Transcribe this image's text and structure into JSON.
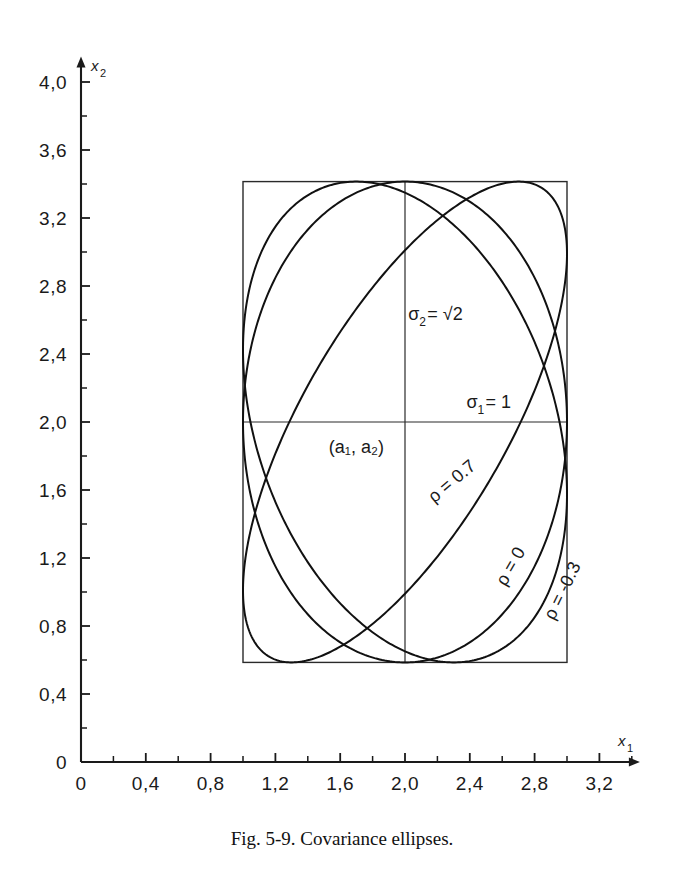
{
  "figure": {
    "caption": "Fig. 5-9.  Covariance ellipses.",
    "caption_number": "Fig. 5-9.",
    "caption_text": "Covariance ellipses."
  },
  "axes": {
    "x": {
      "name": "x",
      "subscript": "1",
      "label": "x₁",
      "ticks": [
        "0",
        "0,4",
        "0,8",
        "1,2",
        "1,6",
        "2,0",
        "2,4",
        "2,8",
        "3,2"
      ],
      "tick_values": [
        0,
        0.4,
        0.8,
        1.2,
        1.6,
        2.0,
        2.4,
        2.8,
        3.2
      ],
      "minor_step": 0.2,
      "range": [
        0,
        3.45
      ],
      "origin_label": "0"
    },
    "y": {
      "name": "x",
      "subscript": "2",
      "label": "x₂",
      "ticks": [
        "0",
        "0,4",
        "0,8",
        "1,2",
        "1,6",
        "2,0",
        "2,4",
        "2,8",
        "3,2",
        "3,6",
        "4,0"
      ],
      "tick_values": [
        0,
        0.4,
        0.8,
        1.2,
        1.6,
        2.0,
        2.4,
        2.8,
        3.2,
        3.6,
        4.0
      ],
      "minor_step": 0.2,
      "range": [
        0,
        4.15
      ],
      "origin_label": "0"
    }
  },
  "annotations": {
    "sigma2": {
      "symbol": "σ",
      "sub": "2",
      "eq": "=",
      "value": "√2",
      "text": "σ₂=√2",
      "x": 2.02,
      "y": 2.6
    },
    "sigma1": {
      "symbol": "σ",
      "sub": "1",
      "eq": "=",
      "value": "1",
      "text": "σ₁ =1",
      "x": 2.38,
      "y": 2.08
    },
    "center": {
      "text": "(a₁, a₂)",
      "x": 1.7,
      "y": 1.82
    }
  },
  "chart_data": {
    "type": "line",
    "title": "Covariance ellipses",
    "xlabel": "x₁",
    "ylabel": "x₂",
    "xlim": [
      0,
      3.45
    ],
    "ylim": [
      0,
      4.15
    ],
    "grid": false,
    "legend": "inline-curve-labels",
    "center": {
      "x": 2.0,
      "y": 2.0,
      "label": "(a₁, a₂)"
    },
    "sigma_1": 1.0,
    "sigma_2": 1.4142,
    "sigma_2_label": "√2",
    "bounding_box": {
      "x_min": 1.0,
      "x_max": 3.0,
      "y_min": 0.5858,
      "y_max": 3.4142
    },
    "series": [
      {
        "name": "rho-0.7",
        "label": "ρ = 0.7",
        "rho": 0.7,
        "label_x": 2.18,
        "label_y": 1.52,
        "label_rotation": -40
      },
      {
        "name": "rho-0",
        "label": "ρ = 0",
        "rho": 0.0,
        "label_x": 2.62,
        "label_y": 1.03,
        "label_rotation": -60
      },
      {
        "name": "rho-neg0.3",
        "label": "ρ = -0.3",
        "rho": -0.3,
        "label_x": 2.92,
        "label_y": 0.83,
        "label_rotation": -64
      }
    ]
  },
  "colors": {
    "ink": "#1a1a1a",
    "curve": "#111111",
    "box": "#2a2a2a",
    "background": "#ffffff"
  }
}
